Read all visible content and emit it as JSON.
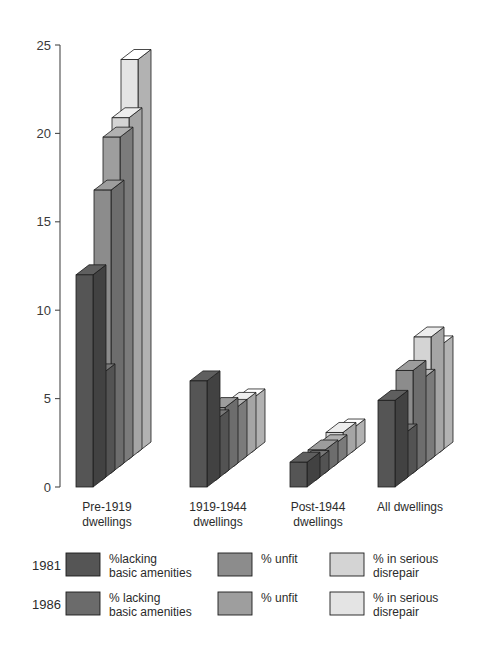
{
  "chart_data": {
    "type": "bar",
    "title": "",
    "subtitle": "",
    "xlabel": "",
    "ylabel": "",
    "ylim": [
      0,
      25
    ],
    "yticks": [
      0,
      5,
      10,
      15,
      20,
      25
    ],
    "ytick_labels": [
      "0",
      "5",
      "10",
      "15",
      "20",
      "25"
    ],
    "grid": false,
    "legend_position": "bottom",
    "style": "3d-grouped-bars",
    "categories": [
      "Pre-1919 dwellings",
      "1919-1944 dwellings",
      "Post-1944 dwellings",
      "All dwellings"
    ],
    "category_lines": [
      [
        "Pre-1919",
        "dwellings"
      ],
      [
        "1919-1944",
        "dwellings"
      ],
      [
        "Post-1944",
        "dwellings"
      ],
      [
        "All dwellings",
        ""
      ]
    ],
    "series": [
      {
        "name": "1981 %lacking basic amenities",
        "year": "1981",
        "metric": "%lacking basic amenities",
        "color": "#555555",
        "values": [
          12.0,
          6.0,
          1.4,
          4.9
        ]
      },
      {
        "name": "1986 % lacking basic amenities",
        "year": "1986",
        "metric": "% lacking basic amenities",
        "color": "#6b6b6b",
        "values": [
          6.0,
          3.4,
          1.1,
          2.6
        ]
      },
      {
        "name": "1981 % unfit",
        "year": "1981",
        "metric": "% unfit",
        "color": "#8c8c8c",
        "values": [
          16.0,
          3.7,
          1.3,
          5.8
        ]
      },
      {
        "name": "1986 % unfit",
        "year": "1986",
        "metric": "% unfit",
        "color": "#9e9e9e",
        "values": [
          18.6,
          3.2,
          1.2,
          4.9
        ]
      },
      {
        "name": "1981 % in serious disrepair",
        "year": "1981",
        "metric": "% in serious disrepair",
        "color": "#d4d4d4",
        "values": [
          19.3,
          3.2,
          1.5,
          6.9
        ]
      },
      {
        "name": "1986 % in serious disrepair",
        "year": "1986",
        "metric": "% in serious disrepair",
        "color": "#e4e4e4",
        "values": [
          22.2,
          3.0,
          1.3,
          6.0
        ]
      }
    ],
    "legend": {
      "rows": [
        {
          "year": "1981",
          "entries": [
            {
              "color": "#555555",
              "label_lines": [
                "%lacking",
                "basic amenities"
              ]
            },
            {
              "color": "#8c8c8c",
              "label_lines": [
                "% unfit",
                ""
              ]
            },
            {
              "color": "#d4d4d4",
              "label_lines": [
                "% in serious",
                "disrepair"
              ]
            }
          ]
        },
        {
          "year": "1986",
          "entries": [
            {
              "color": "#6b6b6b",
              "label_lines": [
                "% lacking",
                "basic amenities"
              ]
            },
            {
              "color": "#9e9e9e",
              "label_lines": [
                "% unfit",
                ""
              ]
            },
            {
              "color": "#e4e4e4",
              "label_lines": [
                "% in serious",
                "disrepair"
              ]
            }
          ]
        }
      ]
    }
  },
  "colors": {
    "background": "#ffffff",
    "axis": "#4a4a4a",
    "outline": "#1c1c1c",
    "text": "#2b2b2b"
  }
}
